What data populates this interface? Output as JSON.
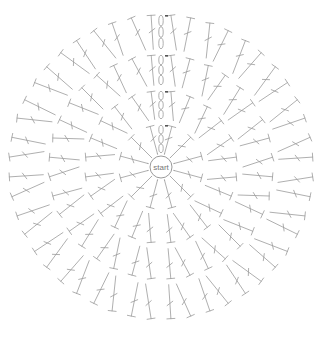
{
  "diagram": {
    "type": "crochet-circle-chart",
    "center_label": "start",
    "center": [
      161,
      167
    ],
    "center_radius": 11,
    "stroke_color": "#9a9a9a",
    "text_color": "#777777",
    "background": "#ffffff",
    "rounds": [
      {
        "round": 1,
        "stitch": "double-crochet",
        "count": 12,
        "inner_r": 14,
        "outer_r": 42,
        "paired": false
      },
      {
        "round": 2,
        "stitch": "double-crochet",
        "count": 24,
        "inner_r": 48,
        "outer_r": 76,
        "paired": true
      },
      {
        "round": 3,
        "stitch": "double-crochet",
        "count": 36,
        "inner_r": 82,
        "outer_r": 112,
        "paired": true
      },
      {
        "round": 4,
        "stitch": "double-crochet",
        "count": 48,
        "inner_r": 118,
        "outer_r": 152,
        "paired": true
      }
    ],
    "starting_chain": {
      "position": "top",
      "links_per_round": 3,
      "rounds": 4
    }
  }
}
